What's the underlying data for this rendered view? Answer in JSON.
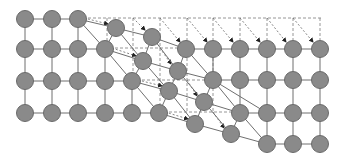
{
  "diagram": {
    "title": "",
    "colors": {
      "node_fill": "#8a8a8a",
      "node_stroke": "#6a6a6a",
      "edge": "#6f6f6f",
      "dashed": "#8a8a8a",
      "arrowhead": "#222222"
    },
    "node_radius": 8.5,
    "nodes": [
      {
        "id": "a1",
        "x": 25,
        "y": 19
      },
      {
        "id": "a2",
        "x": 52,
        "y": 19
      },
      {
        "id": "a3",
        "x": 78,
        "y": 19
      },
      {
        "id": "a4",
        "x": 116,
        "y": 28
      },
      {
        "id": "a5",
        "x": 152,
        "y": 37
      },
      {
        "id": "b1",
        "x": 25,
        "y": 49
      },
      {
        "id": "b2",
        "x": 52,
        "y": 49
      },
      {
        "id": "b3",
        "x": 78,
        "y": 49
      },
      {
        "id": "b4",
        "x": 105,
        "y": 49
      },
      {
        "id": "b5",
        "x": 143,
        "y": 61
      },
      {
        "id": "b6",
        "x": 178,
        "y": 71
      },
      {
        "id": "r2a",
        "x": 186,
        "y": 49
      },
      {
        "id": "r2b",
        "x": 213,
        "y": 49
      },
      {
        "id": "r2c",
        "x": 240,
        "y": 49
      },
      {
        "id": "r2d",
        "x": 267,
        "y": 49
      },
      {
        "id": "r2e",
        "x": 293,
        "y": 49
      },
      {
        "id": "r2f",
        "x": 320,
        "y": 49
      },
      {
        "id": "c1",
        "x": 25,
        "y": 81
      },
      {
        "id": "c2",
        "x": 52,
        "y": 81
      },
      {
        "id": "c3",
        "x": 78,
        "y": 81
      },
      {
        "id": "c4",
        "x": 105,
        "y": 81
      },
      {
        "id": "c5",
        "x": 132,
        "y": 81
      },
      {
        "id": "c6",
        "x": 169,
        "y": 91
      },
      {
        "id": "c7",
        "x": 204,
        "y": 102
      },
      {
        "id": "r3a",
        "x": 213,
        "y": 80
      },
      {
        "id": "r3b",
        "x": 240,
        "y": 80
      },
      {
        "id": "r3c",
        "x": 267,
        "y": 80
      },
      {
        "id": "r3d",
        "x": 293,
        "y": 80
      },
      {
        "id": "r3e",
        "x": 320,
        "y": 80
      },
      {
        "id": "d1",
        "x": 25,
        "y": 113
      },
      {
        "id": "d2",
        "x": 52,
        "y": 113
      },
      {
        "id": "d3",
        "x": 78,
        "y": 113
      },
      {
        "id": "d4",
        "x": 105,
        "y": 113
      },
      {
        "id": "d5",
        "x": 132,
        "y": 113
      },
      {
        "id": "d6",
        "x": 159,
        "y": 113
      },
      {
        "id": "d7",
        "x": 195,
        "y": 124
      },
      {
        "id": "d8",
        "x": 231,
        "y": 134
      },
      {
        "id": "r4a",
        "x": 240,
        "y": 113
      },
      {
        "id": "r4b",
        "x": 267,
        "y": 113
      },
      {
        "id": "r4c",
        "x": 293,
        "y": 113
      },
      {
        "id": "r4d",
        "x": 320,
        "y": 113
      },
      {
        "id": "r5a",
        "x": 267,
        "y": 144
      },
      {
        "id": "r5b",
        "x": 293,
        "y": 144
      },
      {
        "id": "r5c",
        "x": 320,
        "y": 144
      }
    ],
    "edges": [
      [
        "a1",
        "a2"
      ],
      [
        "a2",
        "a3"
      ],
      [
        "a3",
        "a4"
      ],
      [
        "a4",
        "a5"
      ],
      [
        "a5",
        "r2a"
      ],
      [
        "r2a",
        "r2b"
      ],
      [
        "r2b",
        "r2c"
      ],
      [
        "r2c",
        "r2d"
      ],
      [
        "r2d",
        "r2e"
      ],
      [
        "r2e",
        "r2f"
      ],
      [
        "b1",
        "b2"
      ],
      [
        "b2",
        "b3"
      ],
      [
        "b3",
        "b4"
      ],
      [
        "b4",
        "b5"
      ],
      [
        "b5",
        "b6"
      ],
      [
        "b6",
        "r3a"
      ],
      [
        "r3a",
        "r3b"
      ],
      [
        "r3b",
        "r3c"
      ],
      [
        "r3c",
        "r3d"
      ],
      [
        "r3d",
        "r3e"
      ],
      [
        "c1",
        "c2"
      ],
      [
        "c2",
        "c3"
      ],
      [
        "c3",
        "c4"
      ],
      [
        "c4",
        "c5"
      ],
      [
        "c5",
        "c6"
      ],
      [
        "c6",
        "c7"
      ],
      [
        "c7",
        "r4a"
      ],
      [
        "r4a",
        "r4b"
      ],
      [
        "r4b",
        "r4c"
      ],
      [
        "r4c",
        "r4d"
      ],
      [
        "d1",
        "d2"
      ],
      [
        "d2",
        "d3"
      ],
      [
        "d3",
        "d4"
      ],
      [
        "d4",
        "d5"
      ],
      [
        "d5",
        "d6"
      ],
      [
        "d6",
        "d7"
      ],
      [
        "d7",
        "d8"
      ],
      [
        "d8",
        "r5a"
      ],
      [
        "r5a",
        "r5b"
      ],
      [
        "r5b",
        "r5c"
      ],
      [
        "a1",
        "b1"
      ],
      [
        "b1",
        "c1"
      ],
      [
        "c1",
        "d1"
      ],
      [
        "a2",
        "b2"
      ],
      [
        "b2",
        "c2"
      ],
      [
        "c2",
        "d2"
      ],
      [
        "a3",
        "b3"
      ],
      [
        "b3",
        "c3"
      ],
      [
        "c3",
        "d3"
      ],
      [
        "a3",
        "b4"
      ],
      [
        "b4",
        "c4"
      ],
      [
        "c4",
        "d4"
      ],
      [
        "a4",
        "b4"
      ],
      [
        "b4",
        "c5"
      ],
      [
        "c5",
        "d5"
      ],
      [
        "a4",
        "b5"
      ],
      [
        "b5",
        "c5"
      ],
      [
        "c5",
        "d6"
      ],
      [
        "a5",
        "b5"
      ],
      [
        "b5",
        "c6"
      ],
      [
        "c6",
        "d6"
      ],
      [
        "a5",
        "b6"
      ],
      [
        "b6",
        "c6"
      ],
      [
        "c6",
        "d7"
      ],
      [
        "r2a",
        "b6"
      ],
      [
        "b6",
        "c7"
      ],
      [
        "c7",
        "d7"
      ],
      [
        "r2a",
        "r3a"
      ],
      [
        "r3a",
        "c7"
      ],
      [
        "c7",
        "d8"
      ],
      [
        "r2b",
        "r3a"
      ],
      [
        "r3a",
        "r4a"
      ],
      [
        "r4a",
        "d8"
      ],
      [
        "r2c",
        "r3b"
      ],
      [
        "r3b",
        "r4a"
      ],
      [
        "r4a",
        "r5a"
      ],
      [
        "r3a",
        "r4b"
      ],
      [
        "r4b",
        "r5a"
      ],
      [
        "r2d",
        "r3c"
      ],
      [
        "r3c",
        "r4b"
      ],
      [
        "r2e",
        "r3d"
      ],
      [
        "r3d",
        "r4c"
      ],
      [
        "r4c",
        "r5b"
      ],
      [
        "r2f",
        "r3e"
      ],
      [
        "r3e",
        "r4d"
      ],
      [
        "r4d",
        "r5c"
      ]
    ],
    "dashed_lines": [
      {
        "x1": 78,
        "y1": 18,
        "x2": 322,
        "y2": 18
      },
      {
        "x1": 105,
        "y1": 48,
        "x2": 186,
        "y2": 48
      },
      {
        "x1": 132,
        "y1": 80,
        "x2": 213,
        "y2": 80
      },
      {
        "x1": 159,
        "y1": 112,
        "x2": 240,
        "y2": 112
      },
      {
        "x1": 107,
        "y1": 18,
        "x2": 107,
        "y2": 48
      },
      {
        "x1": 133,
        "y1": 18,
        "x2": 133,
        "y2": 80
      },
      {
        "x1": 160,
        "y1": 18,
        "x2": 160,
        "y2": 112
      },
      {
        "x1": 187,
        "y1": 18,
        "x2": 187,
        "y2": 112
      },
      {
        "x1": 213,
        "y1": 18,
        "x2": 213,
        "y2": 112
      },
      {
        "x1": 240,
        "y1": 18,
        "x2": 240,
        "y2": 40
      },
      {
        "x1": 267,
        "y1": 18,
        "x2": 267,
        "y2": 40
      },
      {
        "x1": 293,
        "y1": 18,
        "x2": 293,
        "y2": 40
      },
      {
        "x1": 320,
        "y1": 18,
        "x2": 320,
        "y2": 40
      }
    ],
    "arrows": [
      {
        "x1": 84,
        "y1": 18,
        "x2": 108,
        "y2": 24
      },
      {
        "x1": 133,
        "y1": 18,
        "x2": 145,
        "y2": 30
      },
      {
        "x1": 160,
        "y1": 18,
        "x2": 180,
        "y2": 42
      },
      {
        "x1": 187,
        "y1": 18,
        "x2": 207,
        "y2": 42
      },
      {
        "x1": 213,
        "y1": 18,
        "x2": 233,
        "y2": 42
      },
      {
        "x1": 240,
        "y1": 18,
        "x2": 260,
        "y2": 42
      },
      {
        "x1": 267,
        "y1": 18,
        "x2": 286,
        "y2": 42
      },
      {
        "x1": 293,
        "y1": 18,
        "x2": 313,
        "y2": 42
      },
      {
        "x1": 112,
        "y1": 48,
        "x2": 136,
        "y2": 56
      },
      {
        "x1": 160,
        "y1": 48,
        "x2": 171,
        "y2": 64
      },
      {
        "x1": 138,
        "y1": 80,
        "x2": 162,
        "y2": 86
      },
      {
        "x1": 187,
        "y1": 80,
        "x2": 197,
        "y2": 96
      },
      {
        "x1": 165,
        "y1": 112,
        "x2": 188,
        "y2": 119
      },
      {
        "x1": 213,
        "y1": 112,
        "x2": 224,
        "y2": 128
      }
    ]
  }
}
